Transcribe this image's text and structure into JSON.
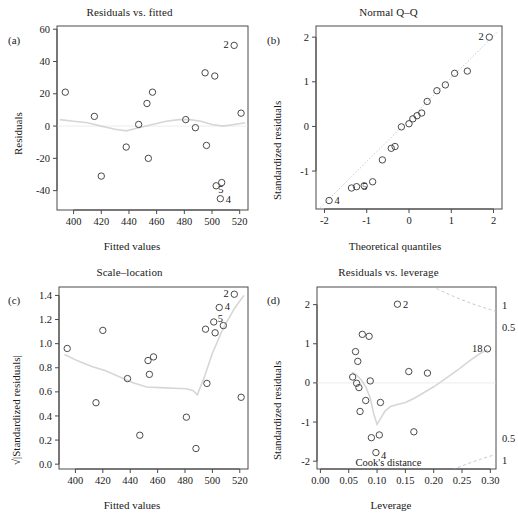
{
  "figure": {
    "background": "#ffffff",
    "point_color": "#4a4a4a",
    "smoother_color": "#d6d6d6",
    "cook_color": "#c4c4c4"
  },
  "panels": {
    "a": {
      "tag": "(a)",
      "title": "Residuals vs. fitted",
      "xlabel": "Fitted values",
      "ylabel": "Residuals"
    },
    "b": {
      "tag": "(b)",
      "title": "Normal Q–Q",
      "xlabel": "Theoretical quantiles",
      "ylabel": "Standardized residuals"
    },
    "c": {
      "tag": "(c)",
      "title": "Scale–location",
      "xlabel": "Fitted values",
      "ylabel": "√|Standardized residuals|"
    },
    "d": {
      "tag": "(d)",
      "title": "Residuals vs. leverage",
      "xlabel": "Leverage",
      "ylabel": "Standardized residuals",
      "annotation": "Cook's distance"
    }
  },
  "chart_data": [
    {
      "panel": "a",
      "type": "scatter",
      "title": "Residuals vs. fitted",
      "xlabel": "Fitted values",
      "ylabel": "Residuals",
      "xlim": [
        388,
        526
      ],
      "ylim": [
        -52,
        62
      ],
      "xticks": [
        400,
        420,
        440,
        460,
        480,
        500,
        520
      ],
      "yticks": [
        -40,
        -20,
        0,
        20,
        40,
        60
      ],
      "grid": false,
      "legend": "none",
      "points": [
        {
          "x": 394,
          "y": 21,
          "label": ""
        },
        {
          "x": 415,
          "y": 6,
          "label": ""
        },
        {
          "x": 420,
          "y": -31,
          "label": ""
        },
        {
          "x": 438,
          "y": -13,
          "label": ""
        },
        {
          "x": 447,
          "y": 1,
          "label": ""
        },
        {
          "x": 453,
          "y": 14,
          "label": ""
        },
        {
          "x": 454,
          "y": -20,
          "label": ""
        },
        {
          "x": 457,
          "y": 21,
          "label": ""
        },
        {
          "x": 481,
          "y": 4,
          "label": ""
        },
        {
          "x": 488,
          "y": -1,
          "label": ""
        },
        {
          "x": 495,
          "y": 33,
          "label": ""
        },
        {
          "x": 496,
          "y": -12,
          "label": ""
        },
        {
          "x": 502,
          "y": 31,
          "label": ""
        },
        {
          "x": 503,
          "y": -37,
          "label": "5"
        },
        {
          "x": 507,
          "y": -35,
          "label": ""
        },
        {
          "x": 506,
          "y": -45,
          "label": "4"
        },
        {
          "x": 516,
          "y": 50,
          "label": "2"
        },
        {
          "x": 521,
          "y": 8,
          "label": ""
        }
      ],
      "smoother": [
        [
          390,
          4
        ],
        [
          400,
          3
        ],
        [
          410,
          2
        ],
        [
          420,
          0
        ],
        [
          430,
          -2
        ],
        [
          438,
          -3
        ],
        [
          447,
          -1
        ],
        [
          457,
          1
        ],
        [
          467,
          3
        ],
        [
          476,
          4
        ],
        [
          484,
          4
        ],
        [
          492,
          3
        ],
        [
          500,
          1
        ],
        [
          508,
          0
        ],
        [
          516,
          1
        ],
        [
          524,
          2
        ]
      ]
    },
    {
      "panel": "b",
      "type": "scatter",
      "title": "Normal Q–Q",
      "xlabel": "Theoretical quantiles",
      "ylabel": "Standardized residuals",
      "xlim": [
        -2.2,
        2.2
      ],
      "ylim": [
        -1.85,
        2.25
      ],
      "xticks": [
        -2,
        -1,
        0,
        1,
        2
      ],
      "yticks": [
        -1,
        0,
        1,
        2
      ],
      "grid": false,
      "legend": "none",
      "reference_line": [
        [
          -2.1,
          -1.82
        ],
        [
          2.1,
          2.12
        ]
      ],
      "points": [
        {
          "x": -1.89,
          "y": -1.66,
          "label": "4"
        },
        {
          "x": -1.36,
          "y": -1.38,
          "label": ""
        },
        {
          "x": -1.24,
          "y": -1.35,
          "label": "5"
        },
        {
          "x": -1.06,
          "y": -1.33,
          "label": ""
        },
        {
          "x": -0.86,
          "y": -1.24,
          "label": ""
        },
        {
          "x": -0.63,
          "y": -0.75,
          "label": ""
        },
        {
          "x": -0.42,
          "y": -0.49,
          "label": ""
        },
        {
          "x": -0.33,
          "y": -0.45,
          "label": ""
        },
        {
          "x": -0.18,
          "y": -0.01,
          "label": ""
        },
        {
          "x": 0.0,
          "y": 0.06,
          "label": ""
        },
        {
          "x": 0.09,
          "y": 0.17,
          "label": ""
        },
        {
          "x": 0.19,
          "y": 0.24,
          "label": ""
        },
        {
          "x": 0.3,
          "y": 0.3,
          "label": ""
        },
        {
          "x": 0.43,
          "y": 0.56,
          "label": ""
        },
        {
          "x": 0.66,
          "y": 0.8,
          "label": ""
        },
        {
          "x": 0.86,
          "y": 0.93,
          "label": ""
        },
        {
          "x": 1.08,
          "y": 1.19,
          "label": ""
        },
        {
          "x": 1.38,
          "y": 1.24,
          "label": ""
        },
        {
          "x": 1.9,
          "y": 2.0,
          "label": "2"
        }
      ]
    },
    {
      "panel": "c",
      "type": "scatter",
      "title": "Scale–location",
      "xlabel": "Fitted values",
      "ylabel": "√|Standardized residuals|",
      "xlim": [
        388,
        526
      ],
      "ylim": [
        -0.04,
        1.47
      ],
      "xticks": [
        400,
        420,
        440,
        460,
        480,
        500,
        520
      ],
      "yticks": [
        0.0,
        0.2,
        0.4,
        0.6,
        0.8,
        1.0,
        1.2,
        1.4
      ],
      "grid": false,
      "legend": "none",
      "points": [
        {
          "x": 394,
          "y": 0.96,
          "label": ""
        },
        {
          "x": 415,
          "y": 0.51,
          "label": ""
        },
        {
          "x": 420,
          "y": 1.11,
          "label": ""
        },
        {
          "x": 438,
          "y": 0.71,
          "label": ""
        },
        {
          "x": 447,
          "y": 0.24,
          "label": ""
        },
        {
          "x": 453,
          "y": 0.86,
          "label": ""
        },
        {
          "x": 454,
          "y": 0.745,
          "label": ""
        },
        {
          "x": 457,
          "y": 0.89,
          "label": ""
        },
        {
          "x": 481,
          "y": 0.39,
          "label": ""
        },
        {
          "x": 488,
          "y": 0.13,
          "label": ""
        },
        {
          "x": 495,
          "y": 1.12,
          "label": ""
        },
        {
          "x": 496,
          "y": 0.67,
          "label": ""
        },
        {
          "x": 501,
          "y": 1.18,
          "label": "5"
        },
        {
          "x": 502,
          "y": 1.09,
          "label": ""
        },
        {
          "x": 505,
          "y": 1.3,
          "label": "4"
        },
        {
          "x": 508,
          "y": 1.15,
          "label": ""
        },
        {
          "x": 516,
          "y": 1.41,
          "label": "2"
        },
        {
          "x": 521,
          "y": 0.555,
          "label": ""
        }
      ],
      "smoother": [
        [
          392,
          0.91
        ],
        [
          402,
          0.855
        ],
        [
          412,
          0.81
        ],
        [
          422,
          0.775
        ],
        [
          432,
          0.725
        ],
        [
          442,
          0.675
        ],
        [
          452,
          0.64
        ],
        [
          462,
          0.635
        ],
        [
          472,
          0.63
        ],
        [
          481,
          0.625
        ],
        [
          486,
          0.61
        ],
        [
          489,
          0.575
        ],
        [
          494,
          0.72
        ],
        [
          500,
          0.92
        ],
        [
          508,
          1.13
        ],
        [
          516,
          1.29
        ],
        [
          523,
          1.4
        ]
      ]
    },
    {
      "panel": "d",
      "type": "scatter",
      "title": "Residuals vs. leverage",
      "xlabel": "Leverage",
      "ylabel": "Standardized residuals",
      "xlim": [
        -0.006,
        0.31
      ],
      "ylim": [
        -2.2,
        2.45
      ],
      "xticks": [
        0.0,
        0.05,
        0.1,
        0.15,
        0.2,
        0.25,
        0.3
      ],
      "yticks": [
        -2,
        -1,
        0,
        1,
        2
      ],
      "grid": false,
      "legend": "none",
      "annotation": "Cook's distance",
      "cook_labels_right": [
        "1",
        "0.5",
        "0.5",
        "1"
      ],
      "points": [
        {
          "x": 0.057,
          "y": 0.15,
          "label": ""
        },
        {
          "x": 0.062,
          "y": 0.8,
          "label": ""
        },
        {
          "x": 0.064,
          "y": -0.01,
          "label": ""
        },
        {
          "x": 0.066,
          "y": 0.55,
          "label": ""
        },
        {
          "x": 0.068,
          "y": -0.12,
          "label": ""
        },
        {
          "x": 0.07,
          "y": -0.73,
          "label": ""
        },
        {
          "x": 0.074,
          "y": 1.24,
          "label": ""
        },
        {
          "x": 0.08,
          "y": -0.45,
          "label": ""
        },
        {
          "x": 0.086,
          "y": 1.19,
          "label": ""
        },
        {
          "x": 0.088,
          "y": 0.05,
          "label": ""
        },
        {
          "x": 0.09,
          "y": -1.4,
          "label": ""
        },
        {
          "x": 0.098,
          "y": -1.78,
          "label": "4"
        },
        {
          "x": 0.104,
          "y": -1.33,
          "label": ""
        },
        {
          "x": 0.106,
          "y": -0.5,
          "label": ""
        },
        {
          "x": 0.136,
          "y": 2.01,
          "label": "2"
        },
        {
          "x": 0.156,
          "y": 0.29,
          "label": ""
        },
        {
          "x": 0.165,
          "y": -1.25,
          "label": ""
        },
        {
          "x": 0.189,
          "y": 0.25,
          "label": ""
        },
        {
          "x": 0.295,
          "y": 0.87,
          "label": "18"
        }
      ],
      "smoother": [
        [
          0.056,
          0.27
        ],
        [
          0.064,
          0.2
        ],
        [
          0.072,
          0.08
        ],
        [
          0.08,
          -0.1
        ],
        [
          0.088,
          -0.38
        ],
        [
          0.094,
          -0.78
        ],
        [
          0.1,
          -1.06
        ],
        [
          0.106,
          -0.92
        ],
        [
          0.114,
          -0.72
        ],
        [
          0.124,
          -0.6
        ],
        [
          0.136,
          -0.55
        ],
        [
          0.15,
          -0.5
        ],
        [
          0.165,
          -0.4
        ],
        [
          0.18,
          -0.27
        ],
        [
          0.2,
          -0.1
        ],
        [
          0.222,
          0.12
        ],
        [
          0.245,
          0.36
        ],
        [
          0.265,
          0.58
        ],
        [
          0.282,
          0.75
        ],
        [
          0.295,
          0.85
        ]
      ]
    }
  ]
}
